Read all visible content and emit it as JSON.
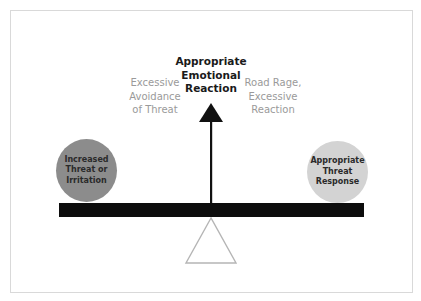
{
  "diagram": {
    "type": "balance-scale",
    "title": {
      "lines": [
        "Appropriate",
        "Emotional",
        "Reaction"
      ]
    },
    "left_label": {
      "lines": [
        "Excessive",
        "Avoidance",
        "of Threat"
      ]
    },
    "right_label": {
      "lines": [
        "Road Rage,",
        "Excessive",
        "Reaction"
      ]
    },
    "left_weight": {
      "lines": [
        "Increased",
        "Threat or",
        "Irritation"
      ],
      "color": "#8c8c8c"
    },
    "right_weight": {
      "lines": [
        "Appropriate",
        "Threat",
        "Response"
      ],
      "color": "#d3d3d3"
    },
    "colors": {
      "beam": "#0d0d0d",
      "arrow": "#111111",
      "fulcrum_outline": "#b5b5b5",
      "frame_border": "#d9d9d9",
      "side_text": "#9a9a9a",
      "title_text": "#1a1a1a"
    }
  }
}
